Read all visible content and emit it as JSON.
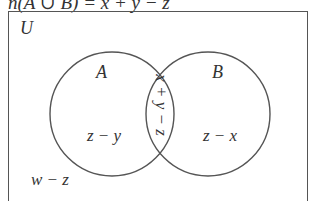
{
  "header": {
    "formula": "n(A ∪ B) = x + y − z"
  },
  "diagram": {
    "universe_label": "U",
    "sets": [
      {
        "name": "A",
        "region_label": "z − y"
      },
      {
        "name": "B",
        "region_label": "z − x"
      }
    ],
    "intersection_label": "x + y − z",
    "outside_label": "w − z",
    "colors": {
      "stroke": "#555555",
      "text": "#333333",
      "background": "#ffffff"
    }
  }
}
